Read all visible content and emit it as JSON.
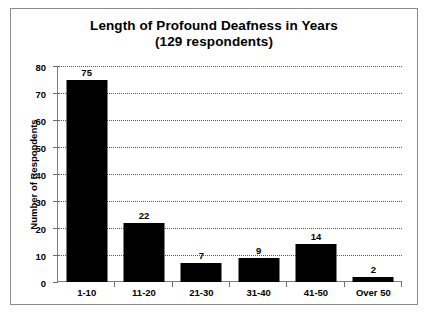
{
  "chart_data": {
    "type": "bar",
    "title": "Length of Profound Deafness in Years",
    "subtitle": "(129 respondents)",
    "categories": [
      "1-10",
      "11-20",
      "21-30",
      "31-40",
      "41-50",
      "Over 50"
    ],
    "values": [
      75,
      22,
      7,
      9,
      14,
      2
    ],
    "data_labels": [
      "75",
      "22",
      "7",
      "9",
      "14",
      "2"
    ],
    "xlabel": "",
    "ylabel": "Number of Respondents",
    "ylim": [
      0,
      80
    ],
    "ytick_step": 10,
    "ytick_labels": [
      "0",
      "10",
      "20",
      "30",
      "40",
      "50",
      "60",
      "70",
      "80"
    ],
    "grid": true,
    "grid_style": "dotted-horizontal",
    "legend": false,
    "bar_color": "#000000",
    "axis_color": "#7d7d7d",
    "frame_color": "#8c8c8c",
    "background": "#ffffff"
  }
}
